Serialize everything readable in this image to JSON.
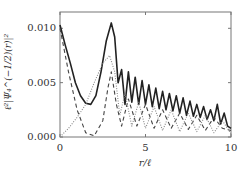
{
  "chart_data": {
    "type": "line",
    "title": "",
    "xlabel": "r/ℓ",
    "ylabel": "ℓ²|Ψ₄^(−1/2)(r)|²",
    "xlim": [
      0,
      10
    ],
    "ylim": [
      0.0,
      0.0115
    ],
    "x_ticks": [
      "0",
      "5",
      "10"
    ],
    "y_ticks": [
      "0.000",
      "0.005",
      "0.010"
    ],
    "grid": false,
    "legend": null,
    "series": [
      {
        "name": "total",
        "style": "solid",
        "color": "#222222",
        "x": [
          0,
          0.3,
          0.6,
          0.9,
          1.2,
          1.5,
          1.8,
          2.1,
          2.4,
          2.7,
          3.0,
          3.2,
          3.4,
          3.6,
          3.8,
          4.0,
          4.2,
          4.4,
          4.6,
          4.8,
          5.0,
          5.2,
          5.4,
          5.6,
          5.8,
          6.0,
          6.2,
          6.4,
          6.6,
          6.8,
          7.0,
          7.2,
          7.4,
          7.6,
          7.8,
          8.0,
          8.2,
          8.4,
          8.6,
          8.8,
          9.0,
          9.2,
          9.4,
          9.6,
          9.8,
          10.0
        ],
        "values": [
          0.0103,
          0.0085,
          0.0068,
          0.005,
          0.0038,
          0.0031,
          0.003,
          0.0038,
          0.006,
          0.0088,
          0.0105,
          0.0092,
          0.005,
          0.0062,
          0.003,
          0.006,
          0.0032,
          0.0055,
          0.003,
          0.0052,
          0.003,
          0.0048,
          0.0028,
          0.0045,
          0.0026,
          0.0042,
          0.0025,
          0.004,
          0.0024,
          0.0038,
          0.0022,
          0.0036,
          0.002,
          0.0033,
          0.0019,
          0.003,
          0.0018,
          0.0028,
          0.0016,
          0.0025,
          0.0015,
          0.003,
          0.0012,
          0.0022,
          0.001,
          0.0008
        ]
      },
      {
        "name": "component-dashed",
        "style": "dashed",
        "color": "#444444",
        "x": [
          0,
          0.5,
          1.0,
          1.5,
          2.0,
          2.5,
          2.8,
          3.0,
          3.3,
          3.6,
          4.0,
          4.5,
          5.0,
          5.5,
          6.0,
          6.5,
          7.0,
          7.5,
          8.0,
          8.5,
          9.0,
          9.5,
          10.0
        ],
        "values": [
          0.01,
          0.006,
          0.0025,
          0.0004,
          0.0001,
          0.0015,
          0.0045,
          0.006,
          0.003,
          0.001,
          0.0035,
          0.001,
          0.003,
          0.0008,
          0.0025,
          0.0008,
          0.0022,
          0.0007,
          0.002,
          0.0006,
          0.0018,
          0.0008,
          0.0006
        ]
      },
      {
        "name": "component-dotted",
        "style": "dotted",
        "color": "#888888",
        "x": [
          0,
          0.5,
          1.0,
          1.5,
          2.0,
          2.5,
          2.9,
          3.2,
          3.5,
          3.8,
          4.2,
          4.6,
          5.0,
          5.5,
          6.0,
          6.5,
          7.0,
          7.5,
          8.0,
          8.5,
          9.0,
          9.5,
          10.0
        ],
        "values": [
          0.0,
          0.0008,
          0.0018,
          0.003,
          0.005,
          0.0068,
          0.0075,
          0.006,
          0.002,
          0.004,
          0.001,
          0.0032,
          0.0008,
          0.0028,
          0.0006,
          0.0025,
          0.0005,
          0.0022,
          0.0005,
          0.002,
          0.0004,
          0.0015,
          0.0003
        ]
      }
    ]
  }
}
